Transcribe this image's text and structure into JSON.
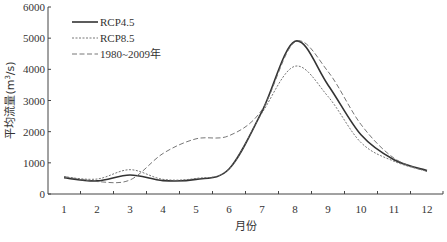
{
  "chart_data": {
    "type": "line",
    "title": "",
    "xlabel": "月份",
    "ylabel": "平均流量(m³/s)",
    "ylabel_parts": {
      "main": "平均流量(m",
      "sup": "3",
      "tail": "/s)"
    },
    "x": [
      1,
      2,
      3,
      4,
      5,
      6,
      7,
      8,
      9,
      10,
      11,
      12
    ],
    "x_tick_labels": [
      "1",
      "2",
      "3",
      "4",
      "5",
      "6",
      "7",
      "8",
      "9",
      "10",
      "11",
      "12"
    ],
    "y_ticks": [
      0,
      1000,
      2000,
      3000,
      4000,
      5000,
      6000
    ],
    "y_tick_labels": [
      "0",
      "1000",
      "2000",
      "3000",
      "4000",
      "5000",
      "6000"
    ],
    "ylim": [
      0,
      6000
    ],
    "xlim": [
      0.5,
      12.5
    ],
    "grid": false,
    "legend_position": "upper-left",
    "series": [
      {
        "name": "RCP4.5",
        "style": "solid",
        "color": "#333333",
        "values": [
          520,
          420,
          610,
          430,
          470,
          800,
          2650,
          4900,
          3500,
          1900,
          1100,
          750
        ]
      },
      {
        "name": "RCP8.5",
        "style": "dotted-dash",
        "color": "#666666",
        "values": [
          550,
          480,
          780,
          470,
          500,
          800,
          2600,
          4100,
          3130,
          1650,
          1050,
          730
        ]
      },
      {
        "name": "1980~2009年",
        "style": "dashed",
        "color": "#666666",
        "values": [
          560,
          400,
          450,
          1300,
          1770,
          1870,
          2700,
          4880,
          3930,
          2230,
          1150,
          720
        ]
      }
    ]
  }
}
